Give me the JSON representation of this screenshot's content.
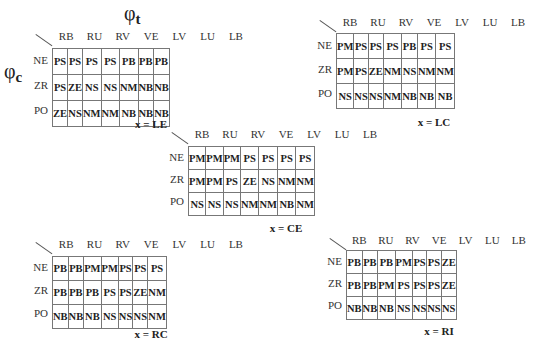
{
  "axes": {
    "column_symbol": "φ",
    "column_subscript": "t",
    "row_symbol": "φ",
    "row_subscript": "c"
  },
  "columns": [
    "RB",
    "RU",
    "RV",
    "VE",
    "LV",
    "LU",
    "LB"
  ],
  "rows": [
    "NE",
    "ZR",
    "PO"
  ],
  "tables": [
    {
      "caption": "x = LE",
      "cells": [
        [
          "PS",
          "PS",
          "PS",
          "PS",
          "PB",
          "PB",
          "PB"
        ],
        [
          "PS",
          "ZE",
          "NS",
          "NS",
          "NM",
          "NB",
          "NB"
        ],
        [
          "ZE",
          "NS",
          "NM",
          "NM",
          "NB",
          "NB",
          "NB"
        ]
      ]
    },
    {
      "caption": "x = LC",
      "cells": [
        [
          "PM",
          "PS",
          "PS",
          "PS",
          "PB",
          "PS",
          "PS"
        ],
        [
          "PM",
          "PS",
          "ZE",
          "NM",
          "NS",
          "NM",
          "NM"
        ],
        [
          "NS",
          "NS",
          "NS",
          "NM",
          "NB",
          "NB",
          "NB"
        ]
      ]
    },
    {
      "caption": "x = CE",
      "cells": [
        [
          "PM",
          "PM",
          "PM",
          "PS",
          "PS",
          "PS",
          "PS"
        ],
        [
          "PM",
          "PM",
          "PS",
          "ZE",
          "NS",
          "NM",
          "NM"
        ],
        [
          "NS",
          "NS",
          "NS",
          "NM",
          "NM",
          "NB",
          "NM"
        ]
      ]
    },
    {
      "caption": "x = RC",
      "cells": [
        [
          "PB",
          "PB",
          "PM",
          "PM",
          "PS",
          "PS",
          "PS"
        ],
        [
          "PB",
          "PB",
          "PB",
          "PS",
          "PS",
          "ZE",
          "NM"
        ],
        [
          "NB",
          "NB",
          "NB",
          "NS",
          "NS",
          "NS",
          "NM"
        ]
      ]
    },
    {
      "caption": "x = RI",
      "cells": [
        [
          "PB",
          "PB",
          "PB",
          "PM",
          "PS",
          "PS",
          "ZE"
        ],
        [
          "PB",
          "PB",
          "PM",
          "PS",
          "PS",
          "PS",
          "ZE"
        ],
        [
          "NB",
          "NB",
          "NB",
          "NS",
          "NS",
          "NS",
          "NS"
        ]
      ]
    }
  ]
}
